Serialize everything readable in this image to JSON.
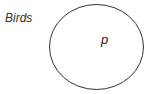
{
  "diagram": {
    "set_label": "Birds",
    "element_label": "p",
    "stroke_color": "#333333",
    "background": "#ffffff"
  }
}
